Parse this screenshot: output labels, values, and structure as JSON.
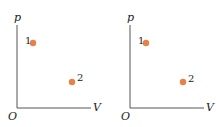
{
  "diagrams": [
    {
      "y_axis_label": "p",
      "x_axis_label": "V",
      "origin_label": "O",
      "points": [
        {
          "label": "1",
          "x": 33,
          "y": 43
        },
        {
          "label": "2",
          "x": 72,
          "y": 82
        }
      ]
    },
    {
      "y_axis_label": "p",
      "x_axis_label": "V",
      "origin_label": "O",
      "points": [
        {
          "label": "1",
          "x": 38,
          "y": 43
        },
        {
          "label": "2",
          "x": 75,
          "y": 82
        }
      ]
    }
  ],
  "colors": {
    "point": "#e8804a",
    "axis": "#555555"
  }
}
